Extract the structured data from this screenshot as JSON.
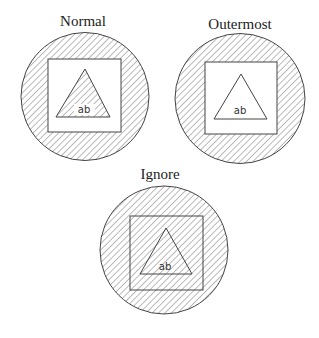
{
  "diagrams": [
    {
      "title": "Normal",
      "label": "ab",
      "title_pos": {
        "x": 83,
        "y": 26
      },
      "circle": {
        "cx": 85,
        "cy": 96.5,
        "r": 64
      },
      "square": {
        "x": 48,
        "y": 59,
        "w": 73,
        "h": 73
      },
      "triangle": "85,69 56,117 110,117",
      "label_pos": {
        "x": 84,
        "y": 113
      },
      "hatched": [
        "circle-ring",
        "triangle"
      ]
    },
    {
      "title": "Outermost",
      "label": "ab",
      "title_pos": {
        "x": 240,
        "y": 29
      },
      "circle": {
        "cx": 240,
        "cy": 98.5,
        "r": 65
      },
      "square": {
        "x": 205,
        "y": 62,
        "w": 72,
        "h": 72
      },
      "triangle": "241,74 214,119 267,119",
      "label_pos": {
        "x": 240,
        "y": 114
      },
      "hatched": [
        "circle-ring"
      ]
    },
    {
      "title": "Ignore",
      "label": "ab",
      "title_pos": {
        "x": 160,
        "y": 179
      },
      "circle": {
        "cx": 164,
        "cy": 250,
        "r": 64
      },
      "square": {
        "x": 130,
        "y": 216,
        "w": 73,
        "h": 74
      },
      "triangle": "166,228 140,274 192,274",
      "label_pos": {
        "x": 165,
        "y": 270
      },
      "hatched": [
        "whole-circle"
      ]
    }
  ],
  "colors": {
    "hatch": "#777777",
    "outline": "#444444",
    "background": "#ffffff"
  }
}
